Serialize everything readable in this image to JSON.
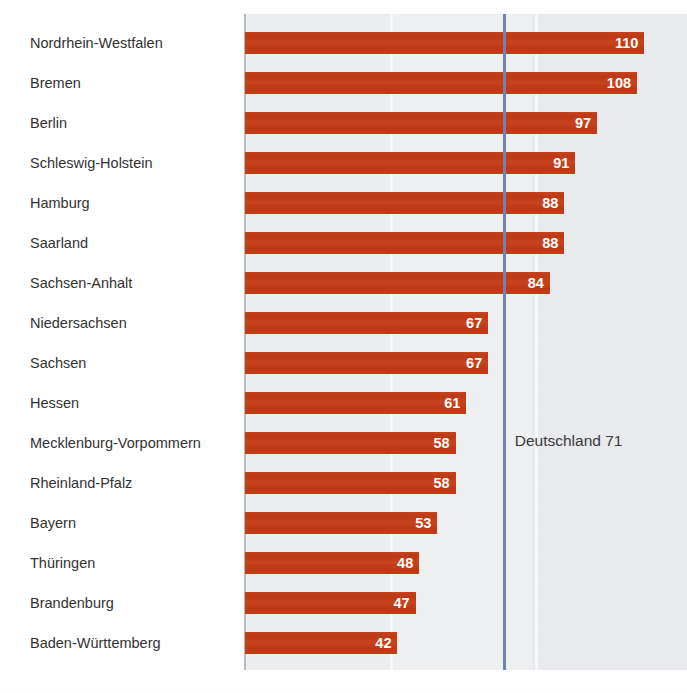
{
  "title": "",
  "reference": {
    "label": "Deutschland 71",
    "value": 71,
    "color": "#6f85b8"
  },
  "style": {
    "bar_color": "#c4391a",
    "plot_background": "#eceef0",
    "axis_color": "#b7bcc2",
    "label_color": "#333333"
  },
  "chart_data": {
    "type": "bar",
    "orientation": "horizontal",
    "title": "",
    "xlabel": "",
    "ylabel": "",
    "xlim": [
      0,
      115
    ],
    "grid": true,
    "legend": false,
    "categories": [
      "Nordrhein-Westfalen",
      "Bremen",
      "Berlin",
      "Schleswig-Holstein",
      "Hamburg",
      "Saarland",
      "Sachsen-Anhalt",
      "Niedersachsen",
      "Sachsen",
      "Hessen",
      "Mecklenburg-Vorpommern",
      "Rheinland-Pfalz",
      "Bayern",
      "Thüringen",
      "Brandenburg",
      "Baden-Württemberg"
    ],
    "values": [
      110,
      108,
      97,
      91,
      88,
      88,
      84,
      67,
      67,
      61,
      58,
      58,
      53,
      48,
      47,
      42
    ],
    "annotations": [
      {
        "text": "Deutschland 71",
        "value": 71,
        "type": "reference-line"
      }
    ]
  },
  "rows": [
    {
      "label": "Nordrhein-Westfalen",
      "value": 110
    },
    {
      "label": "Bremen",
      "value": 108
    },
    {
      "label": "Berlin",
      "value": 97
    },
    {
      "label": "Schleswig-Holstein",
      "value": 91
    },
    {
      "label": "Hamburg",
      "value": 88
    },
    {
      "label": "Saarland",
      "value": 88
    },
    {
      "label": "Sachsen-Anhalt",
      "value": 84
    },
    {
      "label": "Niedersachsen",
      "value": 67
    },
    {
      "label": "Sachsen",
      "value": 67
    },
    {
      "label": "Hessen",
      "value": 61
    },
    {
      "label": "Mecklenburg-Vorpommern",
      "value": 58
    },
    {
      "label": "Rheinland-Pfalz",
      "value": 58
    },
    {
      "label": "Bayern",
      "value": 53
    },
    {
      "label": "Thüringen",
      "value": 48
    },
    {
      "label": "Brandenburg",
      "value": 47
    },
    {
      "label": "Baden-Württemberg",
      "value": 42
    }
  ]
}
